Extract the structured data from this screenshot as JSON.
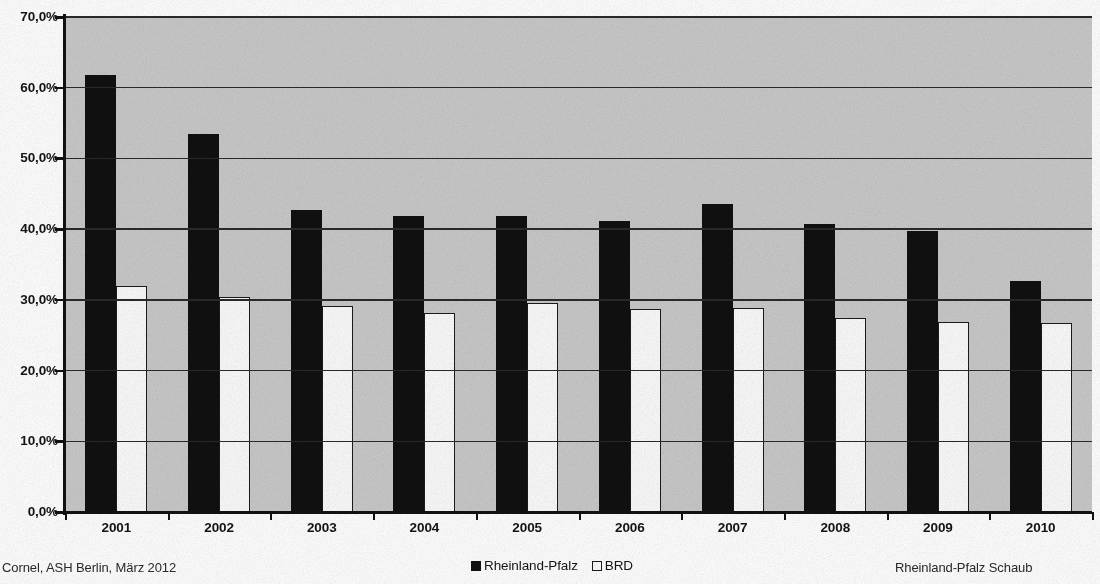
{
  "chart_data": {
    "type": "bar",
    "title": "",
    "subtitle": "",
    "xlabel": "",
    "ylabel": "",
    "categories": [
      "2001",
      "2002",
      "2003",
      "2004",
      "2005",
      "2006",
      "2007",
      "2008",
      "2009",
      "2010"
    ],
    "series": [
      {
        "name": "Rheinland-Pfalz",
        "color": "#101010",
        "values": [
          61.8,
          53.5,
          42.7,
          41.9,
          41.8,
          41.2,
          43.5,
          40.7,
          39.7,
          32.6
        ]
      },
      {
        "name": "BRD",
        "color": "#fbfbfb",
        "values": [
          31.9,
          30.4,
          29.2,
          28.1,
          29.5,
          28.7,
          28.8,
          27.4,
          26.9,
          26.7
        ]
      }
    ],
    "ylim": [
      0,
      70
    ],
    "ytick_step": 10,
    "ytick_labels": [
      "0,0%",
      "10,0%",
      "20,0%",
      "30,0%",
      "40,0%",
      "50,0%",
      "60,0%",
      "70,0%"
    ],
    "ytick_values": [
      0,
      10,
      20,
      30,
      40,
      50,
      60,
      70
    ],
    "grid": true,
    "grid_axis": "y",
    "legend_position": "bottom-center",
    "plot_background": "#c9c9c9",
    "figure_background": "#ffffff"
  },
  "legend": {
    "items": [
      {
        "label": "Rheinland-Pfalz",
        "swatch": "filled-black-square"
      },
      {
        "label": "BRD",
        "swatch": "hollow-white-square"
      }
    ]
  },
  "footer": {
    "left": "Cornel, ASH Berlin, März 2012",
    "right": "Rheinland-Pfalz Schaub"
  }
}
